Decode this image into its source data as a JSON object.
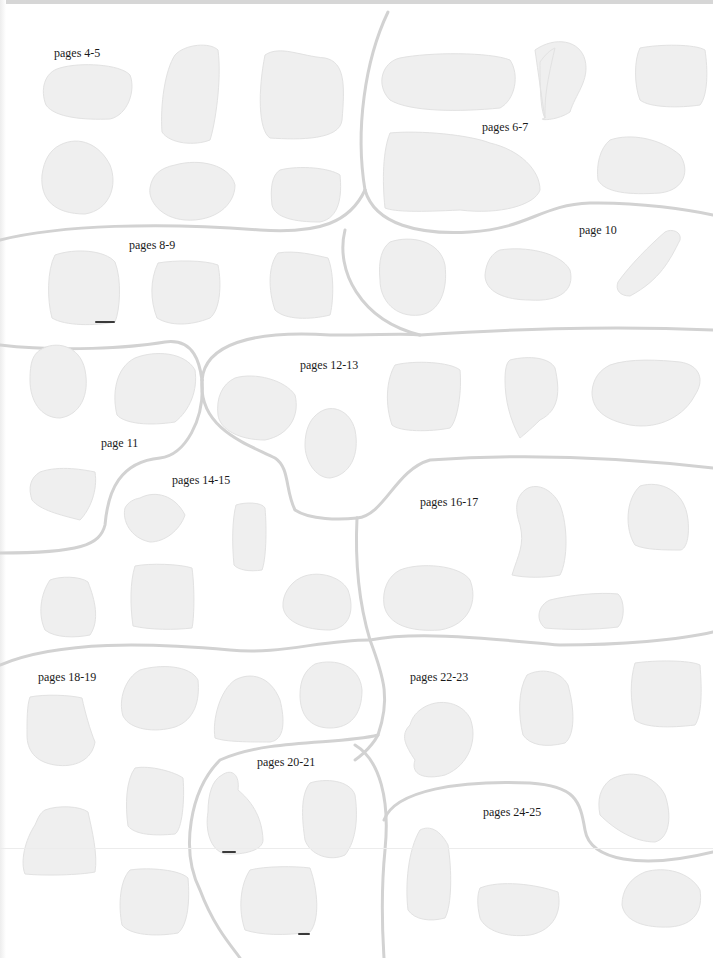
{
  "page": {
    "background": "#ffffff",
    "blob_color": "#efefef",
    "boundary_color": "#d2d2d2",
    "label_color": "#1a1a1a"
  },
  "labels": [
    {
      "id": "pages-4-5",
      "text": "pages 4-5",
      "x": 54,
      "y": 47
    },
    {
      "id": "pages-6-7",
      "text": "pages 6-7",
      "x": 482,
      "y": 121
    },
    {
      "id": "page-10",
      "text": "page 10",
      "x": 579,
      "y": 224
    },
    {
      "id": "pages-8-9",
      "text": "pages 8-9",
      "x": 129,
      "y": 239
    },
    {
      "id": "pages-12-13",
      "text": "pages 12-13",
      "x": 300,
      "y": 359
    },
    {
      "id": "page-11",
      "text": "page 11",
      "x": 101,
      "y": 437
    },
    {
      "id": "pages-14-15",
      "text": "pages 14-15",
      "x": 172,
      "y": 474
    },
    {
      "id": "pages-16-17",
      "text": "pages 16-17",
      "x": 420,
      "y": 496
    },
    {
      "id": "pages-18-19",
      "text": "pages 18-19",
      "x": 38,
      "y": 671
    },
    {
      "id": "pages-22-23",
      "text": "pages 22-23",
      "x": 410,
      "y": 671
    },
    {
      "id": "pages-20-21",
      "text": "pages 20-21",
      "x": 257,
      "y": 756
    },
    {
      "id": "pages-24-25",
      "text": "pages 24-25",
      "x": 483,
      "y": 806
    }
  ],
  "regions": [
    {
      "id": "region-pages-4-5",
      "label": "pages 4-5",
      "blob_count": 6
    },
    {
      "id": "region-pages-6-7",
      "label": "pages 6-7",
      "blob_count": 5
    },
    {
      "id": "region-pages-8-9",
      "label": "pages 8-9",
      "blob_count": 3
    },
    {
      "id": "region-page-10",
      "label": "page 10",
      "blob_count": 3
    },
    {
      "id": "region-page-11",
      "label": "page 11",
      "blob_count": 3
    },
    {
      "id": "region-pages-12-13",
      "label": "pages 12-13",
      "blob_count": 5
    },
    {
      "id": "region-pages-14-15",
      "label": "pages 14-15",
      "blob_count": 5
    },
    {
      "id": "region-pages-16-17",
      "label": "pages 16-17",
      "blob_count": 4
    },
    {
      "id": "region-pages-18-19",
      "label": "pages 18-19",
      "blob_count": 7
    },
    {
      "id": "region-pages-20-21",
      "label": "pages 20-21",
      "blob_count": 3
    },
    {
      "id": "region-pages-22-23",
      "label": "pages 22-23",
      "blob_count": 4
    },
    {
      "id": "region-pages-24-25",
      "label": "pages 24-25",
      "blob_count": 3
    }
  ]
}
